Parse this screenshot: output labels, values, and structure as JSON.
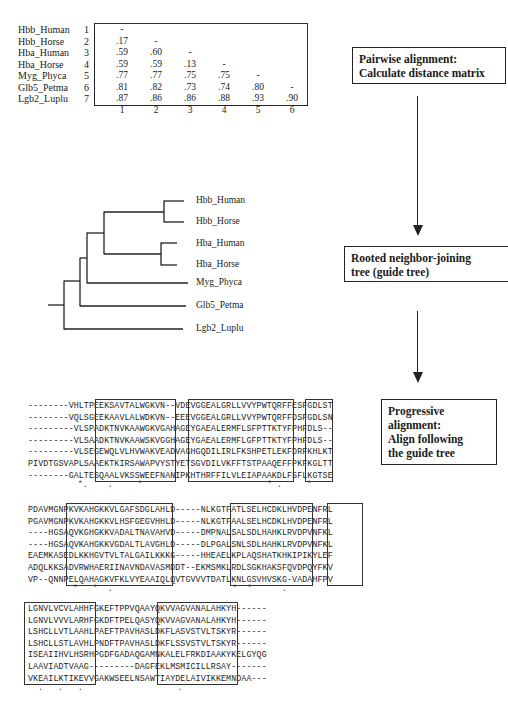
{
  "matrix": {
    "labels": [
      "Hbb_Human",
      "Hbb_Horse",
      "Hba_Human",
      "Hba_Horse",
      "Myg_Phyca",
      "Glb5_Petma",
      "Lgb2_Luplu"
    ],
    "indices": [
      "1",
      "2",
      "3",
      "4",
      "5",
      "6",
      "7"
    ],
    "rows": [
      [
        "-"
      ],
      [
        ".17",
        "-"
      ],
      [
        ".59",
        ".60",
        "-"
      ],
      [
        ".59",
        ".59",
        ".13",
        "-"
      ],
      [
        ".77",
        ".77",
        ".75",
        ".75",
        "-"
      ],
      [
        ".81",
        ".82",
        ".73",
        ".74",
        ".80",
        "-"
      ],
      [
        ".87",
        ".86",
        ".86",
        ".88",
        ".93",
        ".90"
      ]
    ],
    "column_labels": [
      "1",
      "2",
      "3",
      "4",
      "5",
      "6"
    ]
  },
  "steps": [
    {
      "line1": "Pairwise alignment:",
      "line2": "Calculate distance matrix"
    },
    {
      "line1": "Rooted neighbor-joining",
      "line2": "tree (guide tree)"
    },
    {
      "line1": "Progressive",
      "line2": "alignment:",
      "line3": "Align following",
      "line4": "the guide tree"
    }
  ],
  "tree": {
    "leaves": [
      "Hbb_Human",
      "Hbb_Horse",
      "Hba_Human",
      "Hba_Horse",
      "Myg_Phyca",
      "Glb5_Petma",
      "Lgb2_Luplu"
    ]
  },
  "alignment": {
    "block1": {
      "rows": [
        "--------VHLTPEEKSAVTALWGKVN--VDEVGGEALGRLLVVYPWTQRFFESFGDLST",
        "--------VQLSGEEKAAVLALWDKVN--EEEVGGEALGRLLVVYPWTQRFFDSFGDLSN",
        "---------VLSPADKTNVKAAWGKVGAHAGEYGAEALERMFLSFPTTKTYFPHFDLS--",
        "---------VLSAADKTNVKAAWSKVGGHAGEYGAEALERMFLGFPTTKTYFPHFDLS--",
        "---------VLSEGEWQLVLHVWAKVEADVAGHGQDILIRLFKSHPETLEKFDRFKHLKT",
        "PIVDTGSVAPLSAAEKTKIRSAWAPVYSTYETSGVDILVKFFTSTPAAQEFFPKFKGLTT",
        "--------GALTESQAALVKSSWEEFNANIPKHTHRFFILVLEIAPAAKDLFSFLKGTSE"
      ],
      "consensus": "          *.    .     *                         * .     *"
    },
    "block2": {
      "rows": [
        "PDAVMGNPKVKAHGKKVLGAFSDGLAHLD-----NLKGTFATLSELHCDKLHVDPENFRL",
        "PGAVMGNPKVKAHGKKVLHSFGEGVHHLD-----NLKGTFAALSELHCDKLHVDPENFRL",
        "----HGSAQVKGHGKKVADALTNAVAHVD-----DMPNALSALSDLHAHKLRVDPVNFKL",
        "----HGSAQVKAHGKKVGDALTLAVGHLD-----DLPGALSNLSDLHAHKLRVDPVNFKL",
        "EAEMKASEDLKKHGVTVLTALGAILKKKG-----HHEAELKPLAQSHATKHKIPIKYLEF",
        "ADQLKKSADVRWHAERIINAVNDAVASMDDT--EKMSMKLRDLSGKHAKSFQVDPQYFKV",
        "VP--QNNPELQAHAGKVFKLVYEAAIQLQVTGVVVTDATLKNLGSVHVSKG-VADAHFPV"
      ],
      "consensus": "         *   *  .                        *  *      .   "
    },
    "block3": {
      "rows": [
        "LGNVLVCVLAHHFGKEFTPPVQAAYQKVVAGVANALAHKYH------",
        "LGNVLVVVLARHFGKDFTPELQASYQKVVAGVANALAHKYH------",
        "LSHCLLVTLAAHLPAEFTPAVHASLDKFLASVSTVLTSKYR------",
        "LSHCLLSTLAVHLPNDFTPAVHASLDKFLSSVSTVLTSKYR------",
        "ISEAIIHVLHSRHPGDFGADAQGAMNKALELFRKDIAAKYKELGYQG",
        "LAAVIADTVAAG---------DAGFEKLMSMICILLRSAY-------",
        "VKEAILKTIKEVVGAKWSEELNSAWTIAYDELAIVIKKEMNDAA---"
      ],
      "consensus": "  .   .   .                   ."
    }
  }
}
